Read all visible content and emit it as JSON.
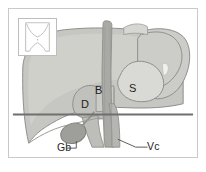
{
  "figure": {
    "type": "anatomical-line-drawing",
    "frame": {
      "border_color": "#c9c9c9",
      "background": "#ffffff"
    },
    "colors": {
      "liver_fill": "#c6c6c2",
      "liver_light": "#d4d4d0",
      "liver_shadow": "#b3b3af",
      "lobe_light": "#d9d9d5",
      "vessel_fill": "#a9a9a5",
      "vessel_dark": "#9a9a96",
      "gallbladder_fill": "#9e9e9a",
      "outline": "#8e8e8a",
      "section_line": "#6f6f6f",
      "label_text": "#1d1d1d",
      "leader_line": "#4a4a4a"
    }
  },
  "inset": {
    "name": "body-orientation-inset",
    "description": "small torso outline showing level of the section",
    "outline_color": "#bdbdbd",
    "fill": "#ffffff"
  },
  "section_plane": {
    "label": "",
    "y": 115,
    "x_start": 12,
    "x_end": 196,
    "color": "#6f6f6f"
  },
  "labels": [
    {
      "id": "B",
      "text": "B",
      "x": 95,
      "y": 85,
      "leader": false,
      "meaning": "bile duct"
    },
    {
      "id": "D",
      "text": "D",
      "x": 81,
      "y": 99,
      "leader": false,
      "meaning": "duodenum"
    },
    {
      "id": "S",
      "text": "S",
      "x": 129,
      "y": 83,
      "leader": false,
      "meaning": "stomach"
    },
    {
      "id": "Gb",
      "text": "Gb",
      "x": 57,
      "y": 142,
      "leader": true,
      "meaning": "gallbladder"
    },
    {
      "id": "Vc",
      "text": "Vc",
      "x": 147,
      "y": 141,
      "leader": true,
      "meaning": "vena cava"
    }
  ]
}
